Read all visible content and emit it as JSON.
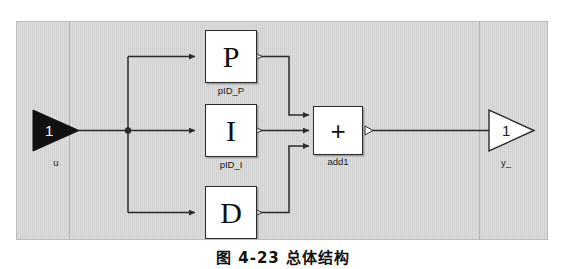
{
  "figure": {
    "kind": "block-diagram",
    "caption": "图 4-23   总体结构",
    "canvas_color": "#d8d8d8",
    "line_color": "#2b2b2b",
    "block_fill": "#ffffff"
  },
  "ports": {
    "input": {
      "number": "1",
      "label": "u",
      "style": "filled-triangle",
      "fill": "#111111",
      "number_color": "#ffffff"
    },
    "output": {
      "number": "1",
      "label": "y_",
      "style": "outline-triangle",
      "fill": "#ffffff",
      "number_color": "#1a1a1a"
    }
  },
  "blocks": [
    {
      "id": "pid_p",
      "glyph": "P",
      "label": "pID_P",
      "glyph_font": "serif"
    },
    {
      "id": "pid_i",
      "glyph": "I",
      "label": "pID_I",
      "glyph_font": "serif"
    },
    {
      "id": "pid_d",
      "glyph": "D",
      "label": "pID_D",
      "glyph_font": "serif"
    },
    {
      "id": "add1",
      "glyph": "+",
      "label": "add1",
      "glyph_font": "sans"
    }
  ],
  "signals": {
    "junction_label": "",
    "branch_count": "3",
    "sum_inputs": "3"
  }
}
